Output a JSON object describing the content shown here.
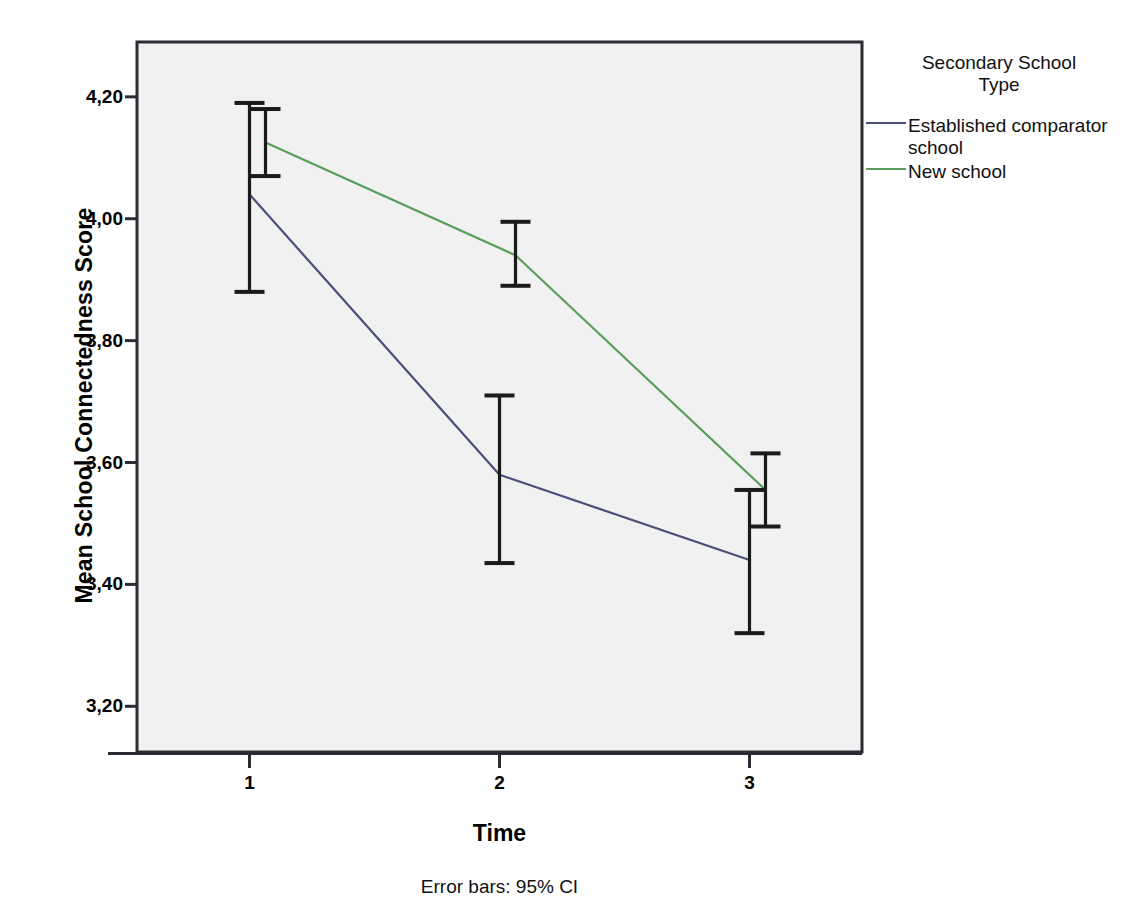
{
  "chart_data": {
    "type": "line",
    "title": "",
    "xlabel": "Time",
    "ylabel": "Mean School Connectedness Score",
    "footnote": "Error bars: 95% CI",
    "legend_title_line1": "Secondary School",
    "legend_title_line2": "Type",
    "legend_position": "right",
    "grid": false,
    "categories": [
      "1",
      "2",
      "3"
    ],
    "x": [
      1,
      2,
      3
    ],
    "xlim": [
      0.55,
      3.45
    ],
    "ylim": [
      3.125,
      4.29
    ],
    "yticks": [
      3.2,
      3.4,
      3.6,
      3.8,
      4.0,
      4.2
    ],
    "ytick_labels": [
      "3,20",
      "3,40",
      "3,60",
      "3,80",
      "4,00",
      "4,20"
    ],
    "xtick_labels": [
      "1",
      "2",
      "3"
    ],
    "error_bar_type": "95% CI",
    "series": [
      {
        "name": "Established comparator school",
        "color": "#4a4f7a",
        "values": [
          4.04,
          3.58,
          3.44
        ],
        "ci_lower": [
          3.88,
          3.435,
          3.32
        ],
        "ci_upper": [
          4.19,
          3.71,
          3.555
        ]
      },
      {
        "name": "New school",
        "color": "#5a9e5a",
        "values": [
          4.125,
          3.94,
          3.555
        ],
        "ci_lower": [
          4.07,
          3.89,
          3.495
        ],
        "ci_upper": [
          4.18,
          3.995,
          3.615
        ]
      }
    ]
  },
  "style": {
    "plot_background": "#f1f1f1",
    "border_color": "#2b2b33",
    "error_bar_color": "#1a1a1a",
    "page_background": "#ffffff"
  }
}
